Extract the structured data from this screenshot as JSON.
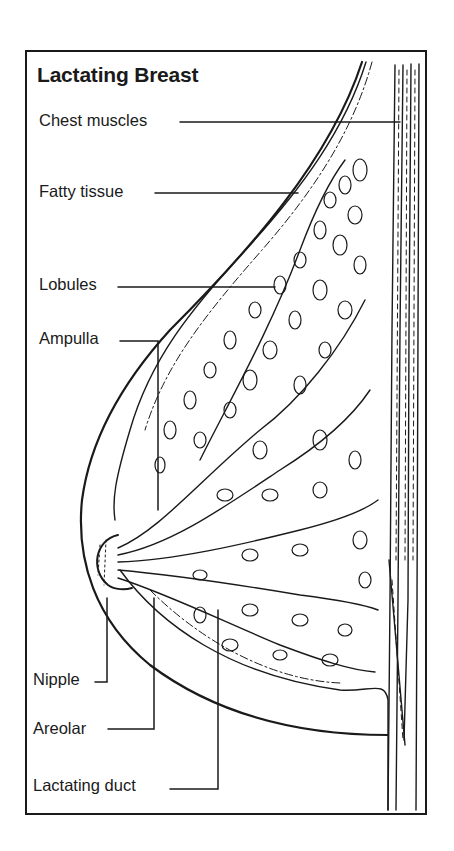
{
  "title": "Lactating Breast",
  "labels": [
    {
      "id": "chest-muscles",
      "text": "Chest muscles",
      "x": 39,
      "y": 111
    },
    {
      "id": "fatty-tissue",
      "text": "Fatty tissue",
      "x": 39,
      "y": 182
    },
    {
      "id": "lobules",
      "text": "Lobules",
      "x": 39,
      "y": 275
    },
    {
      "id": "ampulla",
      "text": "Ampulla",
      "x": 39,
      "y": 329
    },
    {
      "id": "nipple",
      "text": "Nipple",
      "x": 33,
      "y": 670
    },
    {
      "id": "areolar",
      "text": "Areolar",
      "x": 33,
      "y": 719
    },
    {
      "id": "lactating-duct",
      "text": "Lactating duct",
      "x": 33,
      "y": 776
    }
  ],
  "colors": {
    "ink": "#1a1a1a",
    "background": "#ffffff"
  }
}
